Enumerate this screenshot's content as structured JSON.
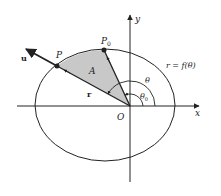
{
  "figure": {
    "colors": {
      "ink": "#222222",
      "shade": "#c8c8c8",
      "background": "#ffffff"
    },
    "labels": {
      "x_axis": "x",
      "y_axis": "y",
      "origin": "O",
      "point_p": "P",
      "point_p0_base": "P",
      "point_p0_sub": "0",
      "area": "A",
      "vector_r": "r",
      "vector_u": "u",
      "angle_theta": "θ",
      "angle_theta0_base": "θ",
      "angle_theta0_sub": "0",
      "curve": "r = f(θ)"
    }
  }
}
